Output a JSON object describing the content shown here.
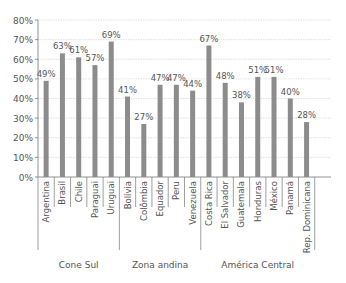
{
  "chart_data": {
    "type": "bar",
    "title": "",
    "xlabel": "",
    "ylabel": "",
    "ylim": [
      0,
      80
    ],
    "yticks": [
      "0%",
      "10%",
      "20%",
      "30%",
      "40%",
      "50%",
      "60%",
      "70%",
      "80%"
    ],
    "grid": true,
    "bar_color": "#8c8c8c",
    "categories": [
      "Argentina",
      "Brasil",
      "Chile",
      "Paraguai",
      "Uruguai",
      "Bolívia",
      "Colômbia",
      "Equador",
      "Peru",
      "Venezuela",
      "Costa Rica",
      "El Salvador",
      "Guatemala",
      "Honduras",
      "México",
      "Panamá",
      "Rep. Dominicana"
    ],
    "values": [
      49,
      63,
      61,
      57,
      69,
      41,
      27,
      47,
      47,
      44,
      67,
      48,
      38,
      51,
      51,
      40,
      28
    ],
    "value_labels": [
      "49%",
      "63%",
      "61%",
      "57%",
      "69%",
      "41%",
      "27%",
      "47%",
      "47%",
      "44%",
      "67%",
      "48%",
      "38%",
      "51%",
      "51%",
      "40%",
      "28%"
    ],
    "groups": [
      {
        "name": "Cone Sul",
        "start": 0,
        "count": 5
      },
      {
        "name": "Zona andina",
        "start": 5,
        "count": 5
      },
      {
        "name": "América Central",
        "start": 10,
        "count": 7
      }
    ]
  }
}
